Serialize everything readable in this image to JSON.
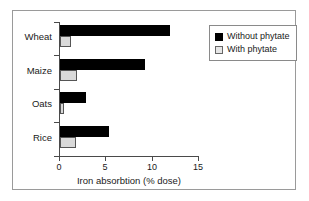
{
  "chart_data": {
    "type": "bar",
    "orientation": "horizontal",
    "title": "",
    "xlabel": "Iron absorbtion (% dose)",
    "ylabel": "",
    "xlim": [
      0,
      15
    ],
    "xticks": [
      0,
      5,
      10,
      15
    ],
    "xtick_labels": [
      "0",
      "5",
      "10",
      "15"
    ],
    "grid": false,
    "legend_position": "top-right",
    "categories": [
      "Wheat",
      "Maize",
      "Oats",
      "Rice"
    ],
    "series": [
      {
        "name": "Without phytate",
        "color": "#000000",
        "values": [
          11.8,
          9.1,
          2.8,
          5.3
        ]
      },
      {
        "name": "With phytate",
        "color": "#d9d9d9",
        "values": [
          1.2,
          1.8,
          0.4,
          1.7
        ]
      }
    ]
  },
  "legend": {
    "items": [
      {
        "label": "Without phytate",
        "swatch": "black-square"
      },
      {
        "label": "With phytate",
        "swatch": "gray-square"
      }
    ]
  }
}
